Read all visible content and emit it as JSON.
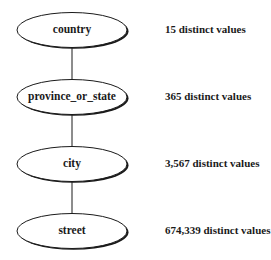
{
  "diagram": {
    "type": "concept-hierarchy",
    "nodes": [
      {
        "id": "country",
        "label": "country",
        "count_text": "15 distinct values",
        "cx": 72,
        "cy": 30
      },
      {
        "id": "province_or_state",
        "label": "province_or_state",
        "count_text": "365 distinct values",
        "cx": 72,
        "cy": 97
      },
      {
        "id": "city",
        "label": "city",
        "count_text": "3,567 distinct values",
        "cx": 72,
        "cy": 164
      },
      {
        "id": "street",
        "label": "street",
        "count_text": "674,339 distinct values",
        "cx": 72,
        "cy": 231
      }
    ],
    "edges": [
      {
        "from": "country",
        "to": "province_or_state"
      },
      {
        "from": "province_or_state",
        "to": "city"
      },
      {
        "from": "city",
        "to": "street"
      }
    ],
    "style": {
      "stroke": "#1a1a1a",
      "fill": "#ffffff",
      "shadow": "#1a1a1a"
    }
  }
}
